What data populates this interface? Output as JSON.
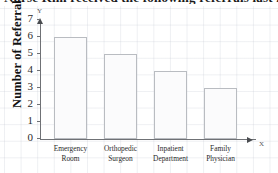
{
  "title": {
    "text": "Nurse Kim received the following referrals last month"
  },
  "axis_caps": {
    "y": "Y",
    "x": "X"
  },
  "chart_data": {
    "type": "bar",
    "title": "Nurse Kim received the following referrals last month",
    "xlabel": "",
    "ylabel": "Number of Referrals",
    "categories": [
      "Emergency Room",
      "Orthopedic Surgeon",
      "Inpatient Department",
      "Family Physician"
    ],
    "category_lines": [
      [
        "Emergency",
        "Room"
      ],
      [
        "Orthopedic",
        "Surgeon"
      ],
      [
        "Inpatient",
        "Department"
      ],
      [
        "Family",
        "Physician"
      ]
    ],
    "values": [
      6,
      5,
      4,
      3
    ],
    "ylim": [
      0,
      7
    ],
    "yticks": [
      0,
      1,
      2,
      3,
      4,
      5,
      6,
      7
    ],
    "ytick_labels": [
      "0",
      "1",
      "2",
      "3",
      "4",
      "5",
      "6",
      "7"
    ],
    "grid": true,
    "legend": false,
    "bar_fill": "#fbfbfc",
    "bar_border": "#b9bcc1",
    "axis_color": "#6f7175"
  }
}
